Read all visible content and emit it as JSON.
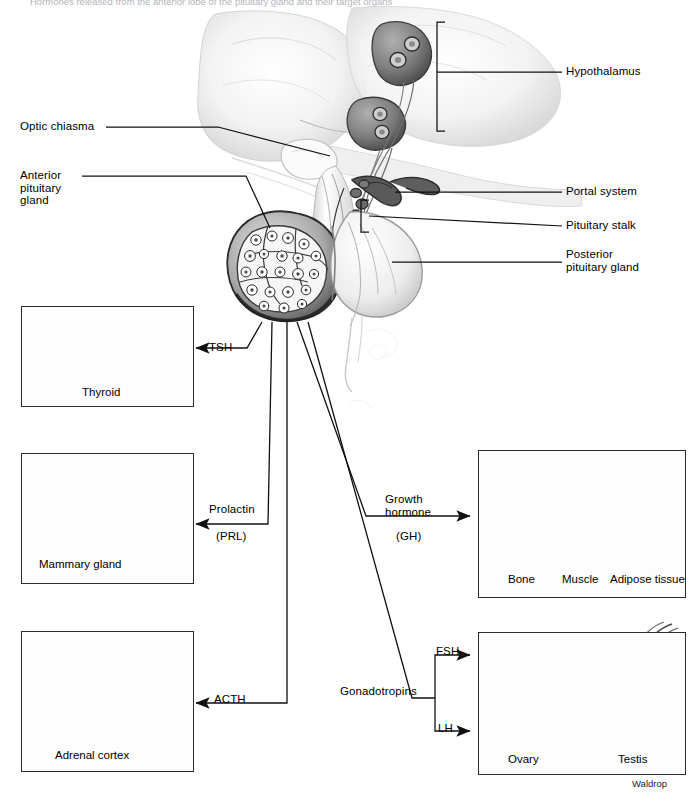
{
  "figure": {
    "top_caption": "Hormones released from the anterior lobe of the pituitary gland and their target organs",
    "credit": "Waldrop"
  },
  "anatomy_labels": [
    {
      "id": "hypothalamus",
      "text": "Hypothalamus"
    },
    {
      "id": "optic-chiasma",
      "text": "Optic chiasma"
    },
    {
      "id": "anterior-pituitary",
      "text": "Anterior\npituitary\ngland"
    },
    {
      "id": "portal-system",
      "text": "Portal system"
    },
    {
      "id": "pituitary-stalk",
      "text": "Pituitary stalk"
    },
    {
      "id": "posterior-pituitary",
      "text": "Posterior\npituitary gland"
    }
  ],
  "hormones": [
    {
      "id": "tsh",
      "label": "TSH",
      "sub": ""
    },
    {
      "id": "prolactin",
      "label": "Prolactin",
      "sub": "(PRL)"
    },
    {
      "id": "acth",
      "label": "ACTH",
      "sub": ""
    },
    {
      "id": "growth-hormone",
      "label": "Growth\nhormone",
      "sub": "(GH)"
    },
    {
      "id": "gonadotropins",
      "label": "Gonadotropins",
      "sub": ""
    },
    {
      "id": "fsh",
      "label": "FSH",
      "sub": ""
    },
    {
      "id": "lh",
      "label": "LH",
      "sub": ""
    }
  ],
  "target_boxes": [
    {
      "id": "thyroid-box",
      "captions": [
        "Thyroid"
      ]
    },
    {
      "id": "mammary-box",
      "captions": [
        "Mammary gland"
      ]
    },
    {
      "id": "adrenal-box",
      "captions": [
        "Adrenal cortex"
      ]
    },
    {
      "id": "growth-target-box",
      "captions": [
        "Bone",
        "Muscle",
        "Adipose tissue"
      ]
    },
    {
      "id": "gonad-box",
      "captions": [
        "Ovary",
        "Testis"
      ]
    }
  ],
  "box_labels": {
    "thyroid": "Thyroid",
    "mammary_gland": "Mammary gland",
    "adrenal_cortex": "Adrenal cortex",
    "bone": "Bone",
    "muscle": "Muscle",
    "adipose": "Adipose tissue",
    "ovary": "Ovary",
    "testis": "Testis"
  },
  "colors": {
    "line": "#1a1a1a",
    "box_border": "#2b2b2b",
    "tissue_light": "#d8d8d8",
    "tissue_mid": "#a8a8a8",
    "tissue_dark": "#6e6e6e",
    "background": "#ffffff"
  }
}
